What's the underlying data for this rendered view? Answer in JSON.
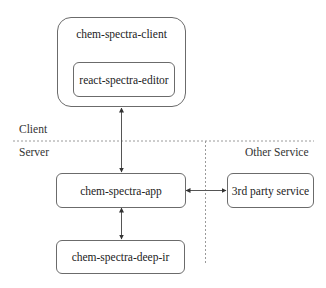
{
  "diagram": {
    "zones": {
      "client_label": "Client",
      "server_label": "Server",
      "other_service_label": "Other Service"
    },
    "nodes": [
      {
        "id": "client",
        "label": "chem-spectra-client"
      },
      {
        "id": "editor",
        "label": "react-spectra-editor",
        "parent": "client"
      },
      {
        "id": "app",
        "label": "chem-spectra-app"
      },
      {
        "id": "third_party",
        "label": "3rd party service"
      },
      {
        "id": "deep_ir",
        "label": "chem-spectra-deep-ir"
      }
    ],
    "edges": [
      {
        "from": "client",
        "to": "app",
        "direction": "bidirectional"
      },
      {
        "from": "app",
        "to": "third_party",
        "direction": "bidirectional"
      },
      {
        "from": "app",
        "to": "deep_ir",
        "direction": "bidirectional"
      }
    ],
    "colors": {
      "stroke": "#6b6b6b",
      "divider": "#9a9a9a",
      "text": "#222222"
    }
  }
}
